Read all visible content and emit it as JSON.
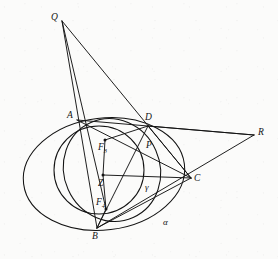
{
  "figure": {
    "caption": "",
    "background_color": "#fbfbfa",
    "stroke_color": "#131313",
    "width": 278,
    "height": 259
  },
  "points": [
    {
      "id": "Q",
      "label": "Q",
      "x": 62,
      "y": 21,
      "label_x": 51,
      "label_y": 13
    },
    {
      "id": "A",
      "label": "A",
      "x": 77,
      "y": 120,
      "label_x": 67,
      "label_y": 111
    },
    {
      "id": "D",
      "label": "D",
      "x": 148,
      "y": 126,
      "label_x": 145,
      "label_y": 113
    },
    {
      "id": "R",
      "label": "R",
      "x": 254,
      "y": 135,
      "label_x": 258,
      "label_y": 128
    },
    {
      "id": "F3",
      "label": "F",
      "sub": "3",
      "x": 105,
      "y": 140,
      "label_x": 98,
      "label_y": 143
    },
    {
      "id": "P",
      "label": "P",
      "x": 143,
      "y": 147,
      "label_x": 146,
      "label_y": 141
    },
    {
      "id": "Z",
      "label": "Z",
      "x": 103,
      "y": 175,
      "label_x": 98,
      "label_y": 179
    },
    {
      "id": "C",
      "label": "C",
      "x": 191,
      "y": 178,
      "label_x": 194,
      "label_y": 174
    },
    {
      "id": "F4",
      "label": "F",
      "sub": "4",
      "x": 106,
      "y": 209,
      "label_x": 96,
      "label_y": 198
    },
    {
      "id": "B",
      "label": "B",
      "x": 97,
      "y": 228,
      "label_x": 92,
      "label_y": 232
    }
  ],
  "conic_labels": [
    {
      "id": "gamma",
      "label": "γ",
      "x": 145,
      "y": 183
    },
    {
      "id": "alpha",
      "label": "α",
      "x": 163,
      "y": 218
    }
  ],
  "conics": [
    {
      "id": "alpha",
      "name": "outer-ellipse-alpha",
      "cx": 104,
      "cy": 174,
      "rx": 81,
      "ry": 56,
      "rotation": -7
    },
    {
      "id": "gamma",
      "name": "inner-conic-gamma",
      "cx": 112,
      "cy": 170,
      "rx": 48,
      "ry": 52,
      "rotation": -24
    },
    {
      "id": "circle-z",
      "name": "circle-centered-z",
      "cx": 99,
      "cy": 170,
      "rx": 45,
      "ry": 44,
      "rotation": 0
    }
  ],
  "segments": [
    {
      "name": "segment-Q-A-B",
      "x1": 62,
      "y1": 21,
      "x2": 97,
      "y2": 228
    },
    {
      "name": "segment-Q-F4-B",
      "x1": 62,
      "y1": 21,
      "x2": 106,
      "y2": 209
    },
    {
      "name": "segment-Q-D-C",
      "x1": 62,
      "y1": 21,
      "x2": 191,
      "y2": 178
    },
    {
      "name": "segment-A-D-R",
      "x1": 77,
      "y1": 120,
      "x2": 254,
      "y2": 135
    },
    {
      "name": "segment-A-P-C",
      "x1": 77,
      "y1": 120,
      "x2": 191,
      "y2": 178
    },
    {
      "name": "segment-D-R",
      "x1": 148,
      "y1": 126,
      "x2": 254,
      "y2": 135
    },
    {
      "name": "segment-D-C",
      "x1": 148,
      "y1": 126,
      "x2": 191,
      "y2": 178
    },
    {
      "name": "segment-D-B",
      "x1": 148,
      "y1": 126,
      "x2": 97,
      "y2": 228
    },
    {
      "name": "segment-R-C-B",
      "x1": 254,
      "y1": 135,
      "x2": 97,
      "y2": 228
    },
    {
      "name": "segment-C-B",
      "x1": 191,
      "y1": 178,
      "x2": 97,
      "y2": 228
    },
    {
      "name": "segment-F3-Z",
      "x1": 105,
      "y1": 140,
      "x2": 103,
      "y2": 175
    },
    {
      "name": "segment-Z-F4",
      "x1": 103,
      "y1": 175,
      "x2": 106,
      "y2": 209
    },
    {
      "name": "segment-Z-C",
      "x1": 103,
      "y1": 175,
      "x2": 191,
      "y2": 178
    },
    {
      "name": "segment-F3-D",
      "x1": 105,
      "y1": 140,
      "x2": 148,
      "y2": 126
    },
    {
      "name": "segment-F4-B",
      "x1": 106,
      "y1": 209,
      "x2": 97,
      "y2": 228
    }
  ],
  "dots": [
    {
      "name": "dot-F3",
      "x": 105,
      "y": 140
    },
    {
      "name": "dot-Z",
      "x": 103,
      "y": 175
    },
    {
      "name": "dot-F4",
      "x": 106,
      "y": 209
    }
  ]
}
